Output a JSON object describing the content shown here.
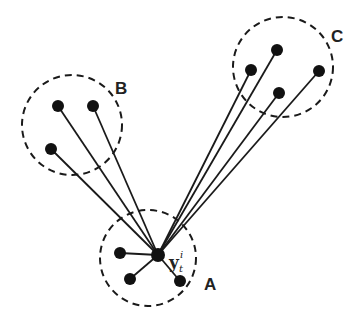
{
  "diagram": {
    "center_node": {
      "label_base": "y",
      "label_sub": "t",
      "label_sup": "i",
      "x": 158,
      "y": 255
    },
    "clusters": [
      {
        "id": "A",
        "label": "A",
        "cx": 148,
        "cy": 258,
        "r": 48,
        "label_x": 204,
        "label_y": 290,
        "nodes": [
          {
            "x": 120,
            "y": 253
          },
          {
            "x": 130,
            "y": 279
          },
          {
            "x": 180,
            "y": 281
          }
        ]
      },
      {
        "id": "B",
        "label": "B",
        "cx": 72,
        "cy": 125,
        "r": 50,
        "label_x": 115,
        "label_y": 94,
        "nodes": [
          {
            "x": 58,
            "y": 106
          },
          {
            "x": 93,
            "y": 106
          },
          {
            "x": 51,
            "y": 149
          }
        ]
      },
      {
        "id": "C",
        "label": "C",
        "cx": 283,
        "cy": 67,
        "r": 50,
        "label_x": 331,
        "label_y": 42,
        "nodes": [
          {
            "x": 277,
            "y": 50
          },
          {
            "x": 251,
            "y": 70
          },
          {
            "x": 279,
            "y": 93
          },
          {
            "x": 319,
            "y": 71
          }
        ]
      }
    ],
    "colors": {
      "stroke": "#1a1a1a",
      "node": "#111111",
      "background": "#ffffff"
    }
  }
}
